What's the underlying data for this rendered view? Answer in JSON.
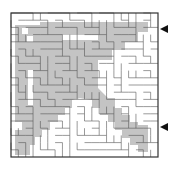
{
  "puzzle": {
    "type": "maze",
    "frame": {
      "x": 11,
      "y": 13,
      "w": 147,
      "h": 144
    },
    "colors": {
      "background": "#ffffff",
      "solution": "#c4c4c4",
      "wall": "#555555",
      "frame": "#333333",
      "arrow": "#111111"
    },
    "arrows": [
      {
        "name": "entrance-arrow",
        "direction": "left",
        "x": 160,
        "y": 29
      },
      {
        "name": "exit-arrow",
        "direction": "left",
        "x": 160,
        "y": 127
      }
    ],
    "shaded_regions": [
      "15,25 40,25 40,22 148,22 148,32 138,32 138,42 125,42 125,50 112,50 112,60 98,60 98,88 108,98 115,98 115,108 122,108 122,115 130,115 130,122 138,122 138,125 148,125 148,152 138,152 138,145 130,145 130,138 122,138 122,130 115,130 115,122 108,122 108,115 100,115 100,108 92,108 92,100 80,98 72,100 72,108 65,108 65,115 58,115 58,122 50,122 50,130 42,130 42,137 35,137 35,145 30,145 30,155 15,155 15,130 22,130 22,122 15,122"
    ],
    "white_holes": [
      "22,28 28,28 28,34 22,34",
      "27,36 33,36 33,42 27,42",
      "62,35 98,35 98,40 62,40",
      "28,70 33,70 33,105 28,105"
    ]
  }
}
